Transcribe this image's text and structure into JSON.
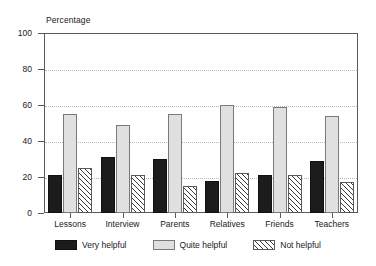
{
  "chart_data": {
    "type": "bar",
    "title": "",
    "subtitle": "",
    "xlabel": "",
    "ylabel": "Percentage",
    "ylim": [
      0,
      100
    ],
    "yticks": [
      0,
      20,
      40,
      60,
      80,
      100
    ],
    "gridlines": [
      20,
      40,
      60,
      80
    ],
    "grid": true,
    "legend_position": "bottom",
    "categories": [
      "Lessons",
      "Interview",
      "Parents",
      "Relatives",
      "Friends",
      "Teachers"
    ],
    "series": [
      {
        "name": "Very helpful",
        "color": "#1c1c1c",
        "fill": "solid-dark",
        "values": [
          21,
          31,
          30,
          18,
          21,
          29
        ]
      },
      {
        "name": "Quite helpful",
        "color": "#e0e0e0",
        "fill": "solid-light",
        "values": [
          55,
          49,
          55,
          60,
          59,
          54
        ]
      },
      {
        "name": "Not helpful",
        "color": "#ffffff",
        "fill": "diagonal-hatch",
        "values": [
          25,
          21,
          15,
          22,
          21,
          17
        ]
      }
    ]
  },
  "axis": {
    "y_title": "Percentage",
    "y_tick_labels": [
      "100",
      "80",
      "60",
      "40",
      "20",
      "0"
    ]
  },
  "legend": {
    "items": [
      {
        "label": "Very helpful",
        "swatch": "solid-dark-swatch"
      },
      {
        "label": "Quite helpful",
        "swatch": "solid-light-swatch"
      },
      {
        "label": "Not helpful",
        "swatch": "diagonal-hatch-swatch"
      }
    ]
  },
  "colors": {
    "very_helpful": "#1c1c1c",
    "quite_helpful": "#e0e0e0",
    "not_helpful": "#ffffff",
    "axis": "#5a5a5a",
    "grid": "#b8b8b8",
    "background": "#ffffff"
  }
}
